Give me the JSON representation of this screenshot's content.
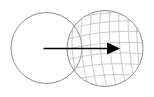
{
  "figure": {
    "title": "Transformation of a plain circle into a mesh-textured circle",
    "caption": "",
    "canvas": {
      "width": 154,
      "height": 97,
      "background": "#ffffff"
    },
    "colors": {
      "outline": "#808080",
      "mesh": "#b4b4b4",
      "arrow": "#000000",
      "background": "#ffffff"
    },
    "shapes": {
      "source_circle": {
        "name": "plain-circle",
        "cx": 46.5,
        "cy": 48.0,
        "r": 35.5,
        "stroke": "#808080",
        "stroke_width": 0.9,
        "fill": "none",
        "filled_with_mesh": false
      },
      "target_circle": {
        "name": "mesh-circle",
        "cx": 105.0,
        "cy": 48.5,
        "r": 38.0,
        "stroke": "#808080",
        "stroke_width": 0.9,
        "fill": "none",
        "filled_with_mesh": true,
        "mesh": {
          "type": "curvilinear-quad-grid",
          "meridian_count": 8,
          "parallel_count": 7,
          "meridian_label": "near-vertical curved lines",
          "parallel_label": "slanted diagonal lines",
          "stroke": "#b4b4b4",
          "stroke_width": 0.7
        }
      }
    },
    "arrow": {
      "name": "transformation-arrow",
      "x1": 43.5,
      "y1": 48.5,
      "x2": 120.0,
      "y2": 48.5,
      "stroke": "#000000",
      "stroke_width": 1.6,
      "head": {
        "length": 13,
        "half_width": 6,
        "fill": "#000000"
      },
      "direction": "left-to-right"
    }
  }
}
